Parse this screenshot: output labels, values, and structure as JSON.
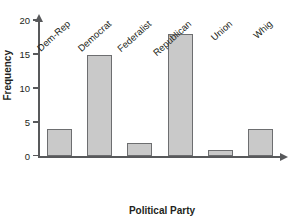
{
  "chart_data": {
    "type": "bar",
    "title": "",
    "xlabel": "Political Party",
    "ylabel": "Frequency",
    "categories": [
      "Dem-Rep",
      "Democrat",
      "Federalist",
      "Republican",
      "Union",
      "Whig"
    ],
    "values": [
      4,
      15,
      2,
      18,
      1,
      4
    ],
    "ylim": [
      0,
      21
    ],
    "yticks": [
      0,
      5,
      10,
      15,
      20
    ],
    "ytick_labels": [
      "0",
      "5",
      "10",
      "15",
      "20"
    ],
    "grid": false,
    "legend": null,
    "bar_fill": "#c9c9c9",
    "bar_border": "#6d6e70",
    "axis_color": "#58595b"
  },
  "axis_titles": {
    "y": "Frequency",
    "x": "Political Party"
  }
}
